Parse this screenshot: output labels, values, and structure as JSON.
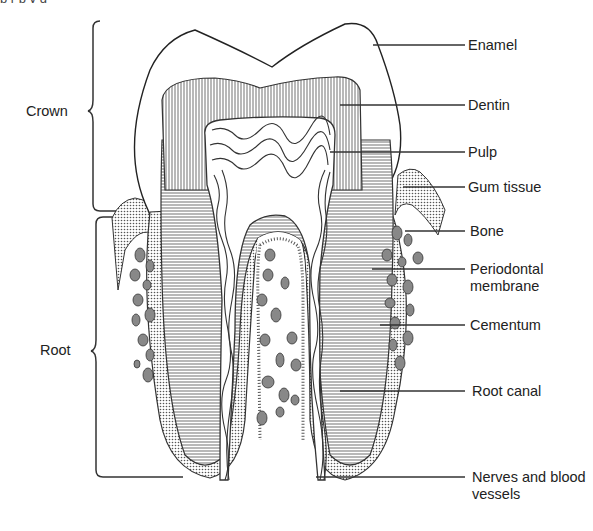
{
  "caption_fragment": "p                     r              p     y                               g",
  "brackets": {
    "crown": {
      "label": "Crown"
    },
    "root": {
      "label": "Root"
    }
  },
  "labels": [
    {
      "id": "enamel",
      "text": "Enamel"
    },
    {
      "id": "dentin",
      "text": "Dentin"
    },
    {
      "id": "pulp",
      "text": "Pulp"
    },
    {
      "id": "gum_tissue",
      "text": "Gum tissue"
    },
    {
      "id": "bone",
      "text": "Bone"
    },
    {
      "id": "periodontal_membrane",
      "text": "Periodontal membrane"
    },
    {
      "id": "cementum",
      "text": "Cementum"
    },
    {
      "id": "root_canal",
      "text": "Root canal"
    },
    {
      "id": "nerves_blood_vessels",
      "text": "Nerves and blood vessels"
    }
  ],
  "colors": {
    "ink": "#222222",
    "background": "#ffffff",
    "stipple": "#888888"
  }
}
